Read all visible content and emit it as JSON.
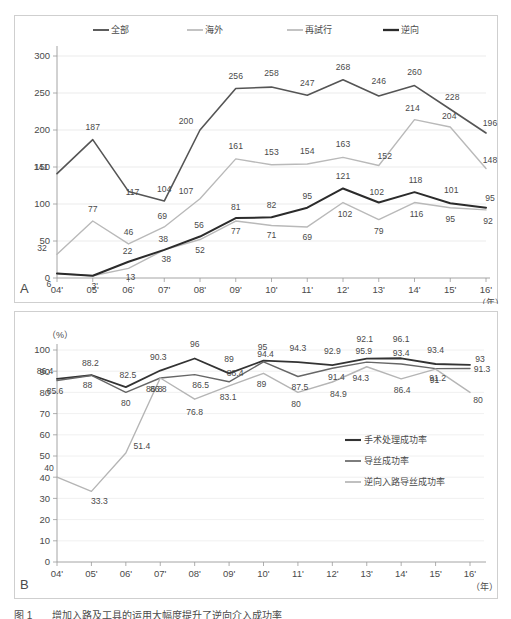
{
  "figure": {
    "caption": "图 1　　增加入路及工具的运用大幅度提升了逆向介入成功率",
    "panelA_letter": "A",
    "panelB_letter": "B"
  },
  "chart_data": [
    {
      "id": "panelA",
      "type": "line",
      "title": "",
      "xlabel": "（年）",
      "ylabel": "",
      "ylim": [
        0,
        300
      ],
      "yticks": [
        0,
        50,
        100,
        150,
        200,
        250,
        300
      ],
      "grid": true,
      "legend_position": "top",
      "categories": [
        "04'",
        "05'",
        "06'",
        "07'",
        "08'",
        "09'",
        "10'",
        "11'",
        "12'",
        "13'",
        "14'",
        "15'",
        "16'"
      ],
      "series": [
        {
          "name": "全部",
          "color": "#555555",
          "width": 1.6,
          "values": [
            141,
            187,
            117,
            104,
            200,
            256,
            258,
            247,
            268,
            246,
            260,
            228,
            196
          ]
        },
        {
          "name": "海外",
          "color": "#b9b9b9",
          "width": 1.4,
          "values": [
            32,
            77,
            46,
            69,
            107,
            161,
            153,
            154,
            163,
            152,
            214,
            204,
            148
          ]
        },
        {
          "name": "再試行",
          "color": "#b9b9b9",
          "width": 1.4,
          "values": [
            6,
            3,
            13,
            38,
            52,
            77,
            71,
            69,
            102,
            79,
            102,
            95,
            92
          ]
        },
        {
          "name": "逆向",
          "color": "#2b2b2b",
          "width": 2.0,
          "values": [
            6,
            3,
            22,
            38,
            56,
            81,
            82,
            95,
            121,
            102,
            116,
            101,
            95
          ]
        }
      ],
      "annotations_top": {
        "全部": [
          141,
          187,
          117,
          104,
          200,
          256,
          258,
          247,
          268,
          246,
          260,
          228,
          196
        ],
        "海外": [
          32,
          77,
          46,
          69,
          107,
          161,
          153,
          154,
          163,
          152,
          214,
          204,
          148
        ],
        "再試行": [
          6,
          3,
          13,
          38,
          52,
          77,
          71,
          69,
          102,
          79,
          102,
          95,
          92
        ],
        "逆向": [
          6,
          18,
          22,
          38,
          56,
          81,
          82,
          95,
          121,
          102,
          118,
          95,
          95
        ]
      }
    },
    {
      "id": "panelB",
      "type": "line",
      "title": "",
      "xlabel": "（年）",
      "ylabel": "（%）",
      "ylim": [
        0,
        100
      ],
      "yticks": [
        0,
        10,
        20,
        30,
        40,
        50,
        60,
        70,
        80,
        90,
        100
      ],
      "grid": true,
      "legend_position": "right",
      "categories": [
        "04'",
        "05'",
        "06'",
        "07'",
        "08'",
        "09'",
        "10'",
        "11'",
        "12'",
        "13'",
        "14'",
        "15'",
        "16'"
      ],
      "series": [
        {
          "name": "手术处理成功率",
          "color": "#333333",
          "width": 1.8,
          "values": [
            86.4,
            88.2,
            82.5,
            90.3,
            96,
            89,
            95,
            94.3,
            92.9,
            95.9,
            96.1,
            93.4,
            93
          ]
        },
        {
          "name": "导丝成功率",
          "color": "#666666",
          "width": 1.4,
          "values": [
            85.6,
            88,
            80,
            86.8,
            88.4,
            85,
            94.4,
            87.5,
            91.4,
            94.3,
            93.4,
            91.2,
            91.3
          ]
        },
        {
          "name": "逆向入路导丝成功率",
          "color": "#b5b5b5",
          "width": 1.4,
          "values": [
            40,
            33.3,
            51.4,
            86.8,
            76.8,
            83.1,
            89,
            80,
            84.9,
            92.1,
            86.4,
            91,
            80
          ]
        }
      ],
      "annotations": {
        "手术处理成功率": [
          "86.4",
          "88.2",
          "82.5",
          "90.3",
          "96",
          "89",
          "95",
          "94.3",
          "92.9",
          "92.1",
          "96.1",
          "93.4",
          "93"
        ],
        "导丝成功率": [
          "85.6",
          "88",
          "80",
          "86.8",
          "86.5",
          "88.4",
          "94.4",
          "87.5",
          "91.4",
          "95.9",
          "93.4",
          "91.2",
          "91.3"
        ],
        "逆向入路导丝成功率": [
          "40",
          "33.3",
          "51.4",
          "86.8",
          "76.8",
          "83.1",
          "89",
          "80",
          "84.9",
          "94.3",
          "86.4",
          "91",
          "80"
        ]
      }
    }
  ]
}
